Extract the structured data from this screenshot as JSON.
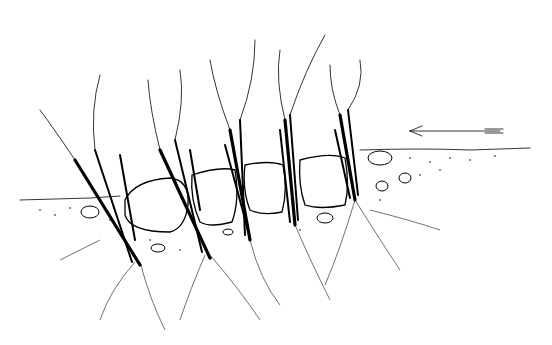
{
  "illustration": {
    "subject": "live willow cuttings planted between boulders on a bank",
    "colors": {
      "ink": "#000000",
      "background": "#ffffff"
    },
    "arrow": {
      "direction": "left",
      "icon": "flow-arrow-icon"
    },
    "plant_clusters": 5,
    "boulders": 4
  }
}
